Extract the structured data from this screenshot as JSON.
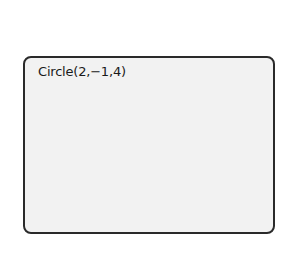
{
  "display": {
    "expression": "Circle(2,−1,4)"
  }
}
